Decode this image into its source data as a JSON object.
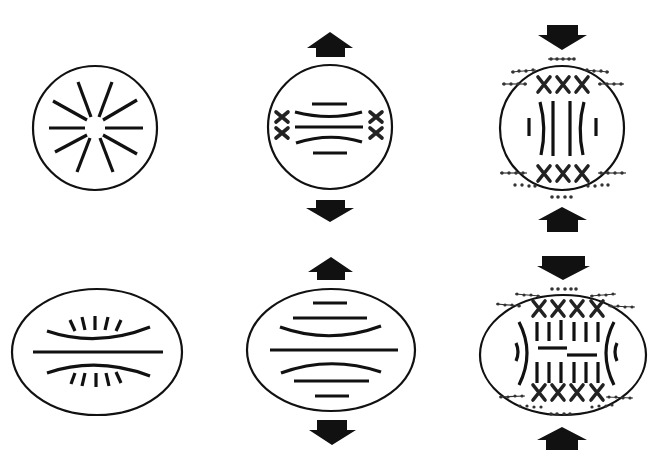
{
  "diagram": {
    "type": "cell shape / spindle deformation schematic",
    "layout": {
      "rows": 2,
      "columns": 3,
      "background": "#ffffff",
      "stroke_color": "#111111"
    },
    "cells": [
      {
        "id": "top-left",
        "shape": "circle",
        "center": [
          95,
          128
        ],
        "radius": 62,
        "content": "radial aster of 10 microtubule lines around empty center",
        "arrows": []
      },
      {
        "id": "top-middle",
        "shape": "circle",
        "center": [
          330,
          127
        ],
        "radius": 62,
        "content": "bipolar bundle of 5 parallel/curved fibers with 2 X-shaped chromosomes on each side",
        "arrows": [
          {
            "direction": "up",
            "position": "above"
          },
          {
            "direction": "down",
            "position": "below"
          }
        ]
      },
      {
        "id": "top-right",
        "shape": "circle",
        "center": [
          562,
          128
        ],
        "radius": 62,
        "content": "vertical fibers with 3 X chromosomes at top and bottom, bead-chain filaments along membrane",
        "arrows": [
          {
            "direction": "down",
            "position": "above"
          },
          {
            "direction": "up",
            "position": "below"
          }
        ]
      },
      {
        "id": "bottom-left",
        "shape": "ellipse",
        "center": [
          97,
          352
        ],
        "radii": [
          85,
          63
        ],
        "content": "central horizontal fiber with two curved fibers and fanned short ticks",
        "arrows": []
      },
      {
        "id": "bottom-middle",
        "shape": "ellipse",
        "center": [
          330,
          350
        ],
        "radii": [
          84,
          61
        ],
        "content": "stack of 7 horizontal fibers (straight and curved)",
        "arrows": [
          {
            "direction": "up",
            "position": "above"
          },
          {
            "direction": "down",
            "position": "below"
          }
        ]
      },
      {
        "id": "bottom-right",
        "shape": "ellipse",
        "center": [
          563,
          355
        ],
        "radii": [
          83,
          60
        ],
        "content": "two rows of 6 vertical fibers, 2 offset horizontal bars, 4 X chromosomes at top and bottom, bead-chain filaments",
        "arrows": [
          {
            "direction": "down",
            "position": "above"
          },
          {
            "direction": "up",
            "position": "below"
          }
        ]
      }
    ],
    "legend": [],
    "labels": []
  }
}
